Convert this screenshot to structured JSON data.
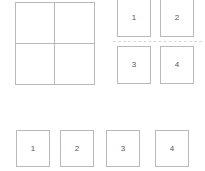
{
  "canvas": {
    "width": 205,
    "height": 171,
    "background": "#ffffff",
    "border_color": "#b9b9b9",
    "divider_color": "#d8d8d8",
    "label_color": "#555555"
  },
  "quadrant_grid": {
    "name": "empty 2x2 grid",
    "rows": 2,
    "columns": 2,
    "cells": [
      "",
      "",
      "",
      ""
    ]
  },
  "top_right_group": {
    "divider_style": "dashed",
    "rows": [
      {
        "cards": [
          {
            "label": "1"
          },
          {
            "label": "2"
          }
        ]
      },
      {
        "cards": [
          {
            "label": "3"
          },
          {
            "label": "4"
          }
        ]
      }
    ]
  },
  "bottom_row": {
    "cards": [
      {
        "label": "1"
      },
      {
        "label": "2"
      },
      {
        "label": "3"
      },
      {
        "label": "4"
      }
    ]
  }
}
